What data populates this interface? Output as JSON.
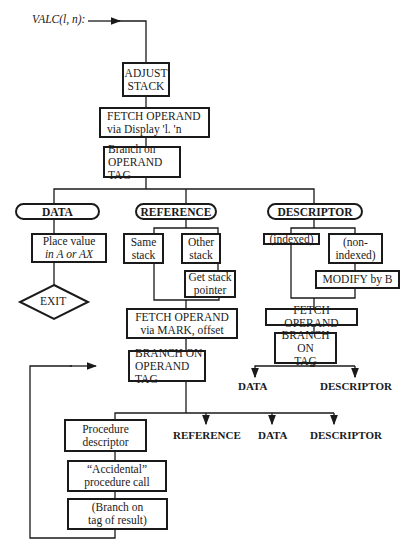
{
  "diagram": {
    "entry_label": "VALC(l, n):",
    "nodes": {
      "adjust_stack": [
        "ADJUST",
        "STACK"
      ],
      "fetch_display": [
        "FETCH OPERAND",
        "via Display 'l. 'n"
      ],
      "branch_operand_tag_1": [
        "Branch on",
        "OPERAND TAG"
      ],
      "data_case": "DATA",
      "reference_case": "REFERENCE",
      "descriptor_case": "DESCRIPTOR",
      "place_value": [
        "Place value",
        "in A or AX"
      ],
      "exit": "EXIT",
      "same_stack": [
        "Same",
        "stack"
      ],
      "other_stack": [
        "Other",
        "stack"
      ],
      "get_stack_pointer": [
        "Get stack",
        "pointer"
      ],
      "fetch_mark": [
        "FETCH OPERAND",
        "via MARK, offset"
      ],
      "indexed": "(indexed)",
      "non_indexed": [
        "(non-",
        "indexed)"
      ],
      "modify_by_b": "MODIFY by B",
      "fetch_operand_desc": "FETCH OPERAND",
      "branch_on_tag_desc": [
        "BRANCH ON",
        "TAG"
      ],
      "desc_out_data": "DATA",
      "desc_out_descriptor": "DESCRIPTOR",
      "branch_operand_tag_2": [
        "BRANCH ON",
        "OPERAND TAG"
      ],
      "procedure_descriptor": [
        "Procedure",
        "descriptor"
      ],
      "accidental_call": [
        "“Accidental”",
        "procedure call"
      ],
      "branch_tag_result": [
        "(Branch on",
        "tag of result)"
      ],
      "out_reference": "REFERENCE",
      "out_data": "DATA",
      "out_descriptor": "DESCRIPTOR"
    }
  }
}
